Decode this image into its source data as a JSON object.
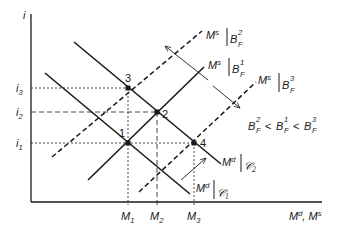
{
  "diagram": {
    "axes": {
      "y_label": "i",
      "x_label": "Md, Ms",
      "y_ticks": [
        "i1",
        "i2",
        "i3"
      ],
      "x_ticks": [
        "M1",
        "M2",
        "M3"
      ]
    },
    "tick_labels": {
      "i1": {
        "base": "i",
        "sub": "1"
      },
      "i2": {
        "base": "i",
        "sub": "2"
      },
      "i3": {
        "base": "i",
        "sub": "3"
      },
      "M1": {
        "base": "M",
        "sub": "1"
      },
      "M2": {
        "base": "M",
        "sub": "2"
      },
      "M3": {
        "base": "M",
        "sub": "3"
      }
    },
    "x_axis_label": {
      "a": "M",
      "a_sup": "d",
      "sep": ", ",
      "b": "M",
      "b_sup": "s"
    },
    "curves": [
      {
        "id": "Md_C1",
        "type": "demand",
        "style": "solid",
        "label": "Md|𝒞1",
        "base": "M",
        "sup": "d",
        "cond": "𝒞",
        "cond_sub": "1"
      },
      {
        "id": "Md_C2",
        "type": "demand",
        "style": "solid",
        "label": "Md|𝒞2",
        "base": "M",
        "sup": "d",
        "cond": "𝒞",
        "cond_sub": "2"
      },
      {
        "id": "Ms_BF1",
        "type": "supply",
        "style": "solid",
        "label": "Ms|BF1",
        "base": "M",
        "sup": "s",
        "cond": "B",
        "cond_sub": "F",
        "cond_sup": "1"
      },
      {
        "id": "Ms_BF2",
        "type": "supply",
        "style": "dashed",
        "label": "Ms|BF2",
        "base": "M",
        "sup": "s",
        "cond": "B",
        "cond_sub": "F",
        "cond_sup": "2"
      },
      {
        "id": "Ms_BF3",
        "type": "supply",
        "style": "dashed",
        "label": "Ms|BF3",
        "base": "M",
        "sup": "s",
        "cond": "B",
        "cond_sub": "F",
        "cond_sup": "3"
      }
    ],
    "points": [
      {
        "label": "1",
        "x_tick": "M1",
        "y_tick": "i1",
        "curves": [
          "Md_C1",
          "Ms_BF1"
        ]
      },
      {
        "label": "2",
        "x_tick": "M2",
        "y_tick": "i2",
        "curves": [
          "Md_C2",
          "Ms_BF1"
        ]
      },
      {
        "label": "3",
        "x_tick": "M1",
        "y_tick": "i3",
        "curves": [
          "Md_C2",
          "Ms_BF2"
        ]
      },
      {
        "label": "4",
        "x_tick": "M3",
        "y_tick": "i1",
        "curves": [
          "Md_C2",
          "Ms_BF3"
        ]
      }
    ],
    "annotation": {
      "text": "BF2 < BF1 < BF3",
      "parts": [
        {
          "base": "B",
          "sub": "F",
          "sup": "2"
        },
        {
          "op": "<"
        },
        {
          "base": "B",
          "sub": "F",
          "sup": "1"
        },
        {
          "op": "<"
        },
        {
          "base": "B",
          "sub": "F",
          "sup": "3"
        }
      ]
    },
    "arrows": [
      {
        "description": "Ms shift between BF1 and BF2/BF3 (double-headed)"
      },
      {
        "description": "Md shift from 𝒞1 to 𝒞2"
      }
    ],
    "colors": {
      "ink": "#1a1a1a",
      "background": "#ffffff"
    }
  }
}
